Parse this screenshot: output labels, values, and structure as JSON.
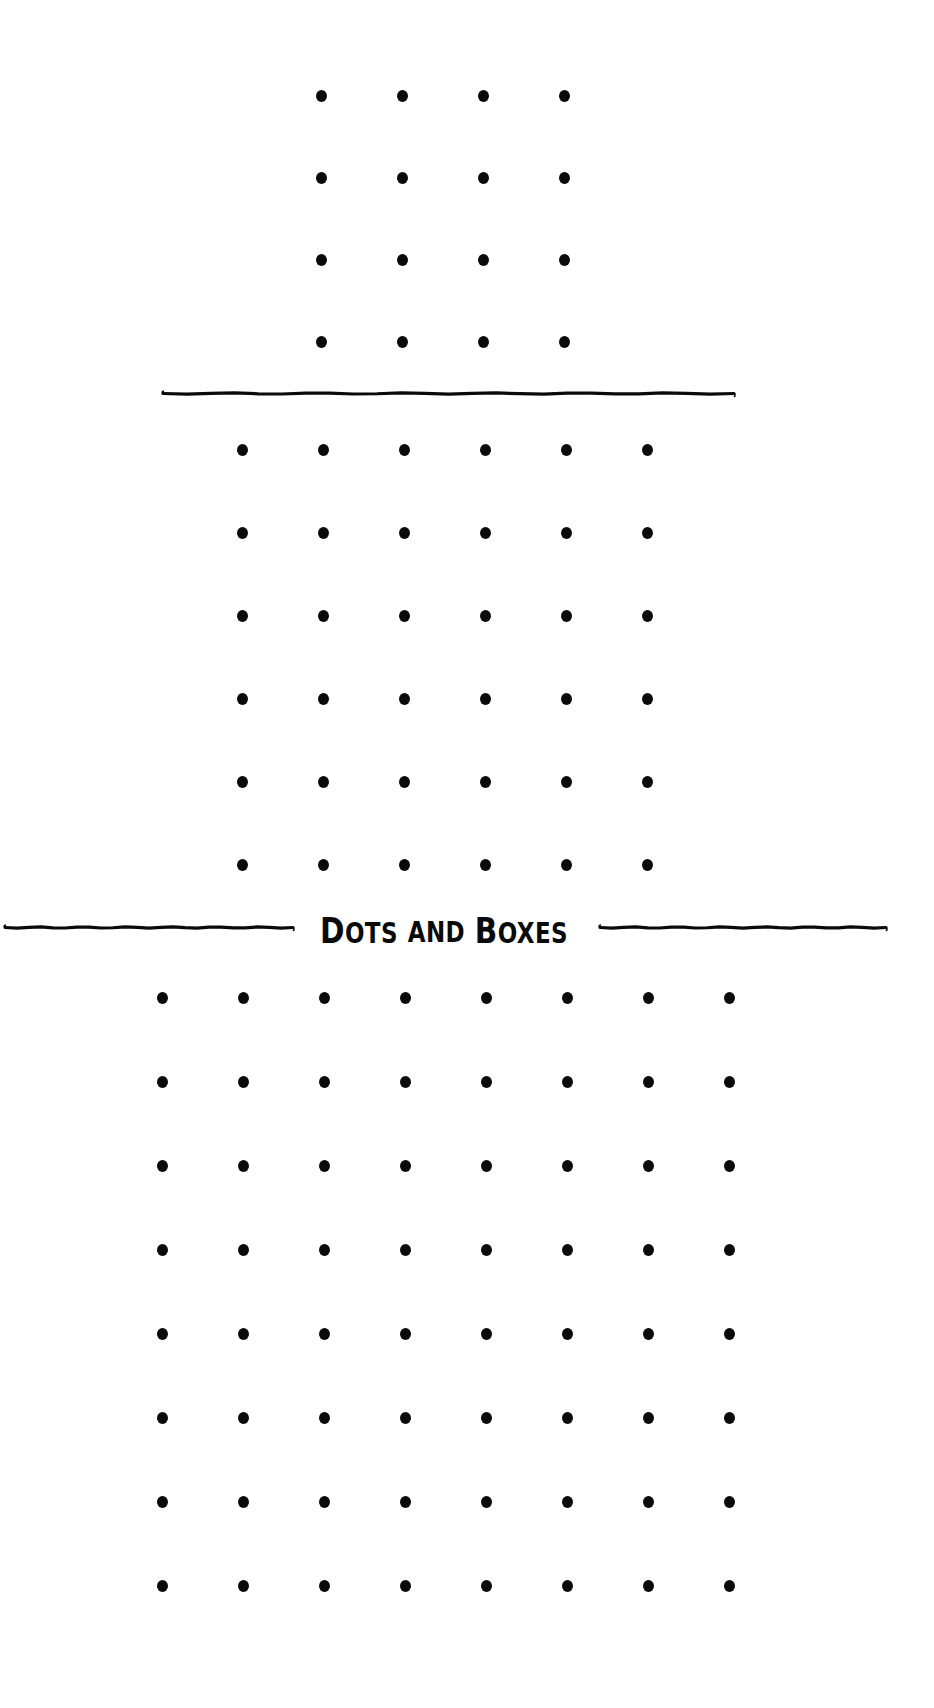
{
  "title": {
    "text": "Dots and Boxes",
    "words": [
      {
        "cap": "D",
        "rest": "OTS"
      },
      {
        "cap": "",
        "rest": "AND"
      },
      {
        "cap": "B",
        "rest": "OXES"
      }
    ]
  },
  "colors": {
    "background": "#ffffff",
    "ink": "#0a0a0a"
  },
  "boards": [
    {
      "name": "small",
      "rows": 4,
      "cols": 4,
      "origin_x": 321,
      "origin_y": 96,
      "spacing_x": 81,
      "spacing_y": 82
    },
    {
      "name": "medium",
      "rows": 6,
      "cols": 6,
      "origin_x": 242,
      "origin_y": 450,
      "spacing_x": 81,
      "spacing_y": 83
    },
    {
      "name": "large",
      "rows": 8,
      "cols": 8,
      "origin_x": 162,
      "origin_y": 998,
      "spacing_x": 81,
      "spacing_y": 84
    }
  ],
  "dividers": [
    {
      "name": "divider-top",
      "x1": 163,
      "x2": 734,
      "y": 393
    },
    {
      "name": "divider-title-left",
      "x1": 5,
      "x2": 293,
      "y": 927
    },
    {
      "name": "divider-title-right",
      "x1": 600,
      "x2": 886,
      "y": 927
    }
  ]
}
